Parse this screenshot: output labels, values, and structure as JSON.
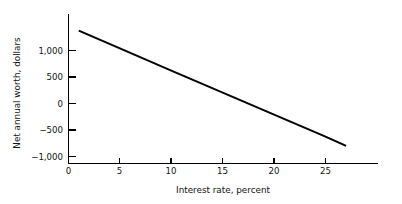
{
  "chart_data": {
    "type": "line",
    "title": "",
    "xlabel": "Interest rate, percent",
    "ylabel": "Net annual worth, dollars",
    "xlim": [
      0,
      29
    ],
    "ylim": [
      -1000,
      1500
    ],
    "grid": false,
    "legend": null,
    "xticks": [
      0,
      5,
      10,
      15,
      20,
      25
    ],
    "xticklabels": [
      "0",
      "5",
      "10",
      "15",
      "20",
      "25"
    ],
    "yticks": [
      1000,
      500,
      0,
      -500,
      -1000
    ],
    "yticklabels": [
      "1,000",
      "500",
      "0",
      "−500",
      "−1,000"
    ],
    "series": [
      {
        "name": "Net annual worth",
        "x": [
          1,
          5,
          10,
          15,
          20,
          25,
          27
        ],
        "values": [
          1375,
          1040,
          620,
          205,
          -210,
          -625,
          -800
        ]
      }
    ],
    "annotations": []
  },
  "axis": {
    "x_axis_name": "x-axis",
    "y_axis_name": "y-axis"
  }
}
